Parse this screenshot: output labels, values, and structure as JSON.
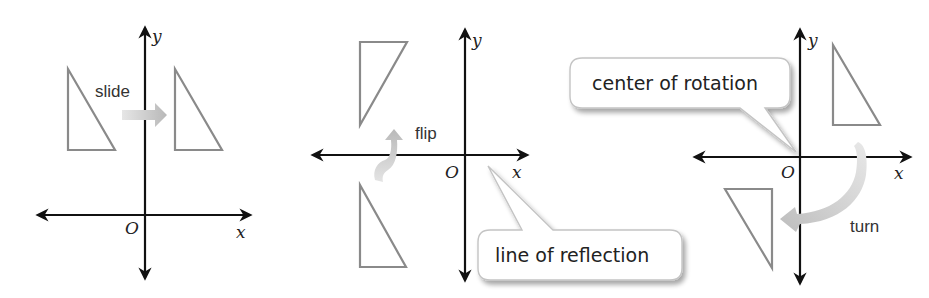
{
  "figure": {
    "colors": {
      "axis": "#111111",
      "triangle_stroke": "#8a8a8a",
      "arrow_fill": "#c8c8c8",
      "bubble_border": "#c4c4c4",
      "bubble_shadow": "#d0d0d0"
    },
    "panels": [
      {
        "name": "translation",
        "axis_labels": {
          "x": "x",
          "y": "y",
          "origin": "O"
        },
        "label": "slide",
        "arrow": "straight-right-arrow"
      },
      {
        "name": "reflection",
        "axis_labels": {
          "x": "x",
          "y": "y",
          "origin": "O"
        },
        "label": "flip",
        "arrow": "curved-up-arrow",
        "callout": "line of reflection"
      },
      {
        "name": "rotation",
        "axis_labels": {
          "x": "x",
          "y": "y",
          "origin": "O"
        },
        "label": "turn",
        "arrow": "curved-clockwise-arrow",
        "callout": "center of rotation"
      }
    ]
  }
}
